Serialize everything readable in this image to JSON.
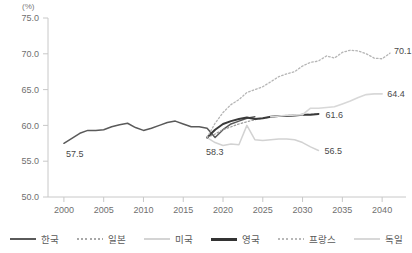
{
  "chart_data": {
    "type": "line",
    "title": "",
    "xlabel": "",
    "ylabel": "",
    "unit_label": "(%)",
    "xlim": [
      1998,
      2043
    ],
    "ylim": [
      50.0,
      75.0
    ],
    "grid": false,
    "legend_position": "bottom",
    "ytick_labels": [
      "50.0",
      "55.0",
      "60.0",
      "65.0",
      "70.0",
      "75.0"
    ],
    "ytick_values": [
      50.0,
      55.0,
      60.0,
      65.0,
      70.0,
      75.0
    ],
    "xtick_labels": [
      "2000",
      "2005",
      "2010",
      "2015",
      "2020",
      "2025",
      "2030",
      "2035",
      "2040"
    ],
    "xtick_values": [
      2000,
      2005,
      2010,
      2015,
      2020,
      2025,
      2030,
      2035,
      2040
    ],
    "annotations": [
      {
        "text": "57.5",
        "x": 2000,
        "y": 57.5,
        "series": "한국"
      },
      {
        "text": "58.3",
        "x": 2018,
        "y": 58.3,
        "series": "한국"
      },
      {
        "text": "61.6",
        "x": 2032,
        "y": 61.6,
        "series": "영국"
      },
      {
        "text": "64.4",
        "x": 2040,
        "y": 64.4,
        "series": "독일"
      },
      {
        "text": "56.5",
        "x": 2032,
        "y": 56.5,
        "series": "미국"
      },
      {
        "text": "70.1",
        "x": 2041,
        "y": 70.1,
        "series": "프랑스"
      }
    ],
    "series": [
      {
        "name": "한국",
        "color": "#5a5a5a",
        "style": "solid",
        "width": 1.5,
        "x": [
          2000,
          2001,
          2002,
          2003,
          2004,
          2005,
          2006,
          2007,
          2008,
          2009,
          2010,
          2011,
          2012,
          2013,
          2014,
          2015,
          2016,
          2017,
          2018,
          2019,
          2020,
          2021,
          2022,
          2023,
          2024
        ],
        "values": [
          57.5,
          58.2,
          58.9,
          59.3,
          59.3,
          59.4,
          59.8,
          60.1,
          60.3,
          59.7,
          59.3,
          59.6,
          60.0,
          60.4,
          60.6,
          60.2,
          59.8,
          59.8,
          59.6,
          58.3,
          59.4,
          60.2,
          60.6,
          61.0,
          61.2
        ]
      },
      {
        "name": "일본",
        "color": "#9a9a9a",
        "style": "dotted",
        "width": 1.2,
        "x": [
          2018,
          2019,
          2020,
          2022,
          2024,
          2026,
          2028,
          2030,
          2032
        ],
        "values": [
          58.3,
          58.8,
          59.4,
          60.2,
          60.8,
          61.2,
          61.4,
          61.5,
          61.6
        ]
      },
      {
        "name": "미국",
        "color": "#d2d2d2",
        "style": "solid",
        "width": 1.5,
        "x": [
          2018,
          2019,
          2020,
          2021,
          2022,
          2023,
          2024,
          2025,
          2026,
          2027,
          2028,
          2029,
          2030,
          2031,
          2032
        ],
        "values": [
          58.3,
          57.6,
          57.2,
          57.4,
          57.3,
          60.0,
          58.0,
          57.9,
          58.0,
          58.1,
          58.1,
          58.0,
          57.6,
          57.0,
          56.5
        ]
      },
      {
        "name": "영국",
        "color": "#3a3a3a",
        "style": "solid",
        "width": 2.0,
        "x": [
          2018,
          2019,
          2020,
          2021,
          2022,
          2023,
          2024,
          2025,
          2026,
          2027,
          2028,
          2029,
          2030,
          2031,
          2032
        ],
        "values": [
          58.3,
          59.4,
          60.2,
          60.6,
          60.9,
          61.1,
          60.9,
          61.0,
          61.2,
          61.3,
          61.3,
          61.4,
          61.5,
          61.5,
          61.6
        ]
      },
      {
        "name": "프랑스",
        "color": "#b5b5b5",
        "style": "dotted",
        "width": 1.3,
        "x": [
          2018,
          2019,
          2020,
          2021,
          2022,
          2023,
          2024,
          2025,
          2026,
          2027,
          2028,
          2029,
          2030,
          2031,
          2032,
          2033,
          2034,
          2035,
          2036,
          2037,
          2038,
          2039,
          2040,
          2041
        ],
        "values": [
          58.3,
          60.3,
          61.8,
          62.9,
          63.6,
          64.6,
          65.0,
          65.4,
          66.1,
          66.8,
          67.2,
          67.5,
          68.3,
          68.8,
          69.0,
          69.7,
          69.4,
          70.2,
          70.5,
          70.4,
          70.0,
          69.4,
          69.3,
          70.1
        ]
      },
      {
        "name": "독일",
        "color": "#d8d8d8",
        "style": "solid",
        "width": 1.6,
        "x": [
          2026,
          2028,
          2030,
          2031,
          2032,
          2033,
          2034,
          2035,
          2036,
          2037,
          2038,
          2039,
          2040
        ],
        "values": [
          61.2,
          61.4,
          61.5,
          62.4,
          62.4,
          62.5,
          62.6,
          63.0,
          63.4,
          63.9,
          64.3,
          64.4,
          64.4
        ]
      }
    ]
  },
  "legend": {
    "items": [
      {
        "label": "한국",
        "color": "#5a5a5a",
        "style": "solid",
        "width": 2
      },
      {
        "label": "일본",
        "color": "#a8a8a8",
        "style": "dotted",
        "width": 1.6
      },
      {
        "label": "미국",
        "color": "#d4d4d4",
        "style": "solid",
        "width": 2
      },
      {
        "label": "영국",
        "color": "#333333",
        "style": "solid",
        "width": 2.6
      },
      {
        "label": "프랑스",
        "color": "#b8b8b8",
        "style": "dotted",
        "width": 1.6
      },
      {
        "label": "독일",
        "color": "#d8d8d8",
        "style": "solid",
        "width": 2
      }
    ]
  }
}
